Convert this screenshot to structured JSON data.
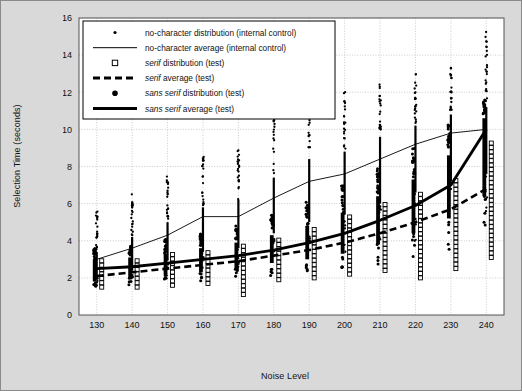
{
  "chart_data": {
    "type": "scatter",
    "title": "",
    "xlabel": "Noise Level",
    "ylabel": "Selection Time (seconds)",
    "xlim": [
      125,
      245
    ],
    "ylim": [
      0,
      16
    ],
    "xticks": [
      130,
      140,
      150,
      160,
      170,
      180,
      190,
      200,
      210,
      220,
      230,
      240
    ],
    "yticks": [
      0,
      2,
      4,
      6,
      8,
      10,
      12,
      14,
      16
    ],
    "grid": true,
    "legend_position": "top-left",
    "legend": [
      {
        "label": "no-character distribution (internal control)",
        "marker": "small-dot",
        "italic_prefix": ""
      },
      {
        "label": "no-character average (internal control)",
        "marker": "thin-line",
        "italic_prefix": ""
      },
      {
        "label": "serif distribution (test)",
        "marker": "open-square",
        "italic_prefix": "serif"
      },
      {
        "label": "serif average (test)",
        "marker": "dashed-line",
        "italic_prefix": "serif"
      },
      {
        "label": "sans serif distribution (test)",
        "marker": "filled-dot",
        "italic_prefix": "sans serif"
      },
      {
        "label": "sans serif average (test)",
        "marker": "thick-line",
        "italic_prefix": "sans serif"
      }
    ],
    "series": [
      {
        "name": "no-character average (internal control)",
        "style": "thin-line",
        "x": [
          130,
          140,
          150,
          160,
          170,
          180,
          190,
          200,
          210,
          220,
          230,
          240
        ],
        "values": [
          3.0,
          3.6,
          4.3,
          5.3,
          5.3,
          6.3,
          7.2,
          7.6,
          8.4,
          9.2,
          9.8,
          10.0
        ]
      },
      {
        "name": "serif average (test)",
        "style": "dashed-line",
        "x": [
          130,
          140,
          150,
          160,
          170,
          180,
          190,
          200,
          210,
          220,
          230,
          240
        ],
        "values": [
          2.1,
          2.3,
          2.5,
          2.7,
          2.9,
          3.2,
          3.5,
          3.9,
          4.4,
          5.0,
          5.7,
          6.8
        ]
      },
      {
        "name": "sans serif average (test)",
        "style": "thick-line",
        "x": [
          130,
          140,
          150,
          160,
          170,
          180,
          190,
          200,
          210,
          220,
          230,
          240
        ],
        "values": [
          2.5,
          2.6,
          2.8,
          3.0,
          3.2,
          3.5,
          3.9,
          4.4,
          5.1,
          5.9,
          7.0,
          10.0
        ]
      }
    ],
    "distributions": [
      {
        "name": "no-character distribution (internal control)",
        "style": "small-dot",
        "x_offset": 0,
        "clusters": [
          {
            "x": 130,
            "low": 1.6,
            "high": 5.6,
            "dense_low": 2.0,
            "dense_high": 3.4
          },
          {
            "x": 140,
            "low": 1.9,
            "high": 6.6,
            "dense_low": 2.4,
            "dense_high": 4.2
          },
          {
            "x": 150,
            "low": 2.2,
            "high": 7.6,
            "dense_low": 3.0,
            "dense_high": 5.0
          },
          {
            "x": 160,
            "low": 2.5,
            "high": 8.6,
            "dense_low": 3.4,
            "dense_high": 5.8
          },
          {
            "x": 170,
            "low": 2.6,
            "high": 9.0,
            "dense_low": 3.6,
            "dense_high": 6.2
          },
          {
            "x": 180,
            "low": 3.0,
            "high": 11.6,
            "dense_low": 4.4,
            "dense_high": 7.4
          },
          {
            "x": 190,
            "low": 3.2,
            "high": 12.0,
            "dense_low": 5.0,
            "dense_high": 8.4
          },
          {
            "x": 200,
            "low": 3.4,
            "high": 12.2,
            "dense_low": 5.4,
            "dense_high": 8.8
          },
          {
            "x": 210,
            "low": 3.6,
            "high": 12.6,
            "dense_low": 6.0,
            "dense_high": 9.6
          },
          {
            "x": 220,
            "low": 4.0,
            "high": 13.0,
            "dense_low": 6.6,
            "dense_high": 10.2
          },
          {
            "x": 230,
            "low": 4.4,
            "high": 13.4,
            "dense_low": 7.2,
            "dense_high": 10.8
          },
          {
            "x": 240,
            "low": 4.6,
            "high": 15.3,
            "dense_low": 7.6,
            "dense_high": 11.2
          }
        ]
      },
      {
        "name": "sans serif distribution (test)",
        "style": "filled-dot",
        "x_offset": -2,
        "clusters": [
          {
            "x": 130,
            "low": 1.5,
            "high": 3.6,
            "dense_low": 1.8,
            "dense_high": 3.0
          },
          {
            "x": 140,
            "low": 1.6,
            "high": 3.8,
            "dense_low": 2.0,
            "dense_high": 3.1
          },
          {
            "x": 150,
            "low": 1.7,
            "high": 4.1,
            "dense_low": 2.2,
            "dense_high": 3.3
          },
          {
            "x": 160,
            "low": 1.8,
            "high": 4.4,
            "dense_low": 2.3,
            "dense_high": 3.6
          },
          {
            "x": 170,
            "low": 1.9,
            "high": 4.8,
            "dense_low": 2.5,
            "dense_high": 3.9
          },
          {
            "x": 180,
            "low": 2.1,
            "high": 5.4,
            "dense_low": 2.8,
            "dense_high": 4.3
          },
          {
            "x": 190,
            "low": 2.3,
            "high": 6.2,
            "dense_low": 3.0,
            "dense_high": 4.8
          },
          {
            "x": 200,
            "low": 2.5,
            "high": 7.0,
            "dense_low": 3.3,
            "dense_high": 5.5
          },
          {
            "x": 210,
            "low": 2.7,
            "high": 8.0,
            "dense_low": 3.8,
            "dense_high": 6.4
          },
          {
            "x": 220,
            "low": 3.0,
            "high": 9.0,
            "dense_low": 4.4,
            "dense_high": 7.3
          },
          {
            "x": 230,
            "low": 3.4,
            "high": 10.4,
            "dense_low": 5.2,
            "dense_high": 8.6
          },
          {
            "x": 240,
            "low": 3.8,
            "high": 11.6,
            "dense_low": 6.4,
            "dense_high": 10.6
          }
        ]
      },
      {
        "name": "serif distribution (test)",
        "style": "open-square",
        "x_offset": 5,
        "clusters": [
          {
            "x": 130,
            "low": 1.5,
            "high": 3.0
          },
          {
            "x": 140,
            "low": 1.5,
            "high": 3.1
          },
          {
            "x": 150,
            "low": 1.6,
            "high": 3.3
          },
          {
            "x": 160,
            "low": 1.7,
            "high": 3.5
          },
          {
            "x": 170,
            "low": 1.1,
            "high": 3.8
          },
          {
            "x": 180,
            "low": 1.9,
            "high": 4.2
          },
          {
            "x": 190,
            "low": 2.0,
            "high": 4.7
          },
          {
            "x": 200,
            "low": 2.2,
            "high": 5.3
          },
          {
            "x": 210,
            "low": 2.4,
            "high": 6.0
          },
          {
            "x": 220,
            "low": 2.0,
            "high": 6.6
          },
          {
            "x": 230,
            "low": 2.5,
            "high": 7.4
          },
          {
            "x": 240,
            "low": 3.1,
            "high": 9.4
          }
        ]
      }
    ]
  },
  "colors": {
    "figure_background": "#d9d9d9",
    "plot_background": "#ffffff",
    "axis": "#333333",
    "grid": "#cccccc",
    "data": "#000000"
  }
}
